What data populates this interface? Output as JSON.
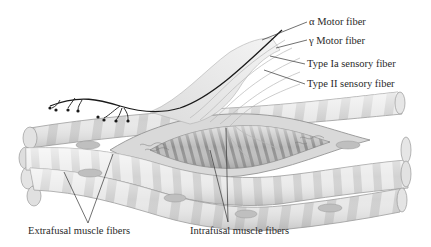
{
  "diagram": {
    "labels": {
      "alpha_motor": "α Motor fiber",
      "gamma_motor": "γ Motor fiber",
      "type_ia": "Type Ia sensory fiber",
      "type_ii": "Type II sensory fiber",
      "extrafusal": "Extrafusal muscle fibers",
      "intrafusal": "Intrafusal muscle fibers"
    },
    "colors": {
      "background": "#ffffff",
      "fiber_light": "#e6e6e6",
      "fiber_band": "#c9c9c9",
      "fiber_outline": "#9a9a9a",
      "nerve_dark": "#1a1a1a",
      "nerve_light": "#f2f2f2",
      "leader_line": "#333333",
      "text": "#2a2a2a"
    }
  }
}
